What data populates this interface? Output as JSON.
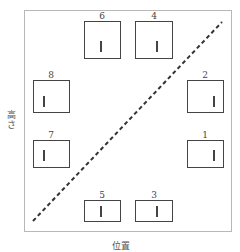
{
  "diagram": {
    "x_axis_label": "位置",
    "y_axis_label": "高さ",
    "divider": {
      "style": "dashed",
      "color": "#333333",
      "from": "bottom-left",
      "to": "top-right"
    },
    "boxes": [
      {
        "id": "1",
        "label": "1",
        "side": "right",
        "row": 3,
        "mark_pos": "right"
      },
      {
        "id": "2",
        "label": "2",
        "side": "right",
        "row": 2,
        "mark_pos": "right"
      },
      {
        "id": "3",
        "label": "3",
        "side": "bottom",
        "row": 4,
        "mark_pos": "center"
      },
      {
        "id": "4",
        "label": "4",
        "side": "top",
        "row": 1,
        "mark_pos": "right"
      },
      {
        "id": "5",
        "label": "5",
        "side": "bottom",
        "row": 4,
        "mark_pos": "center"
      },
      {
        "id": "6",
        "label": "6",
        "side": "top",
        "row": 1,
        "mark_pos": "center"
      },
      {
        "id": "7",
        "label": "7",
        "side": "left",
        "row": 3,
        "mark_pos": "left"
      },
      {
        "id": "8",
        "label": "8",
        "side": "left",
        "row": 2,
        "mark_pos": "left"
      }
    ]
  }
}
